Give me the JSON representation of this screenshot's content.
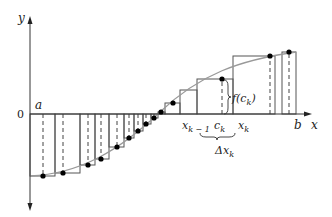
{
  "diagram": {
    "labels": {
      "y_axis": "y",
      "x_axis": "x",
      "origin": "0",
      "a": "a",
      "b": "b",
      "x_k_minus_1": "x",
      "x_k_minus_1_sub": "k − 1",
      "c_k": "c",
      "c_k_sub": "k",
      "x_k": "x",
      "x_k_sub": "k",
      "f_c_k": "f(c",
      "f_c_k_sub": "k",
      "f_c_k_close": ")",
      "delta_x_k": "Δx",
      "delta_x_k_sub": "k"
    },
    "colors": {
      "axis": "#333333",
      "rect": "#555555",
      "curve": "#999999",
      "point": "#000000",
      "dashed": "#444444"
    },
    "partition_x": [
      30,
      55,
      80,
      95,
      109,
      124,
      134,
      143,
      151,
      158,
      165,
      172,
      180,
      188,
      197,
      233,
      275,
      282,
      296
    ],
    "sample_points": [
      [
        43,
        176
      ],
      [
        63,
        173
      ],
      [
        88,
        165
      ],
      [
        101,
        159
      ],
      [
        117,
        147
      ],
      [
        129,
        138
      ],
      [
        138,
        131
      ],
      [
        146,
        124
      ],
      [
        154,
        118
      ],
      [
        161,
        112
      ],
      [
        173,
        103
      ],
      [
        190,
        90
      ],
      [
        222,
        79
      ],
      [
        270,
        56
      ],
      [
        289,
        52
      ]
    ]
  }
}
